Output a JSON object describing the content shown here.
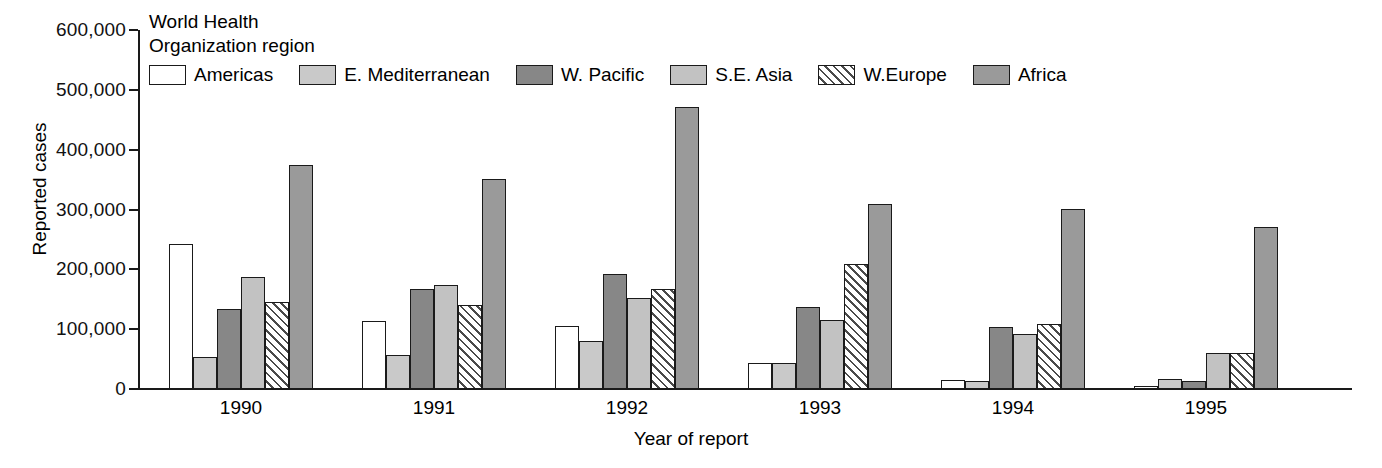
{
  "chart_data": {
    "type": "bar",
    "title": "",
    "xlabel": "Year of report",
    "ylabel": "Reported cases",
    "legend_title": "World Health\nOrganization region",
    "legend_position": "top-inside",
    "grid": false,
    "ylim": [
      0,
      600000
    ],
    "yticks": [
      0,
      100000,
      200000,
      300000,
      400000,
      500000,
      600000
    ],
    "ytick_labels": [
      "0",
      "100,000",
      "200,000",
      "300,000",
      "400,000",
      "500,000",
      "600,000"
    ],
    "categories": [
      "1990",
      "1991",
      "1992",
      "1993",
      "1994",
      "1995"
    ],
    "series": [
      {
        "name": "Americas",
        "key": "americas",
        "fill": "white",
        "color": "#ffffff",
        "values": [
          243000,
          114000,
          105000,
          44000,
          15000,
          5000
        ]
      },
      {
        "name": "E. Mediterranean",
        "key": "emed",
        "fill": "light-gray",
        "color": "#c9c9c9",
        "values": [
          53000,
          57000,
          80000,
          44000,
          13000,
          16000
        ]
      },
      {
        "name": "W. Pacific",
        "key": "wpacific",
        "fill": "dark-gray",
        "color": "#878787",
        "values": [
          134000,
          167000,
          193000,
          137000,
          104000,
          14000
        ]
      },
      {
        "name": "S.E. Asia",
        "key": "seasia",
        "fill": "light-gray",
        "color": "#c2c2c2",
        "values": [
          187000,
          174000,
          152000,
          116000,
          92000,
          60000
        ]
      },
      {
        "name": "W.Europe",
        "key": "weurope",
        "fill": "diagonal-hatch",
        "color": "#ffffff",
        "values": [
          146000,
          141000,
          167000,
          209000,
          109000,
          60000
        ]
      },
      {
        "name": "Africa",
        "key": "africa",
        "fill": "medium-gray",
        "color": "#9a9a9a",
        "values": [
          375000,
          351000,
          472000,
          310000,
          301000,
          270000
        ]
      }
    ]
  },
  "axes": {
    "y_title": "Reported cases",
    "x_title": "Year of report"
  },
  "legend": {
    "title": "World Health\nOrganization region"
  }
}
